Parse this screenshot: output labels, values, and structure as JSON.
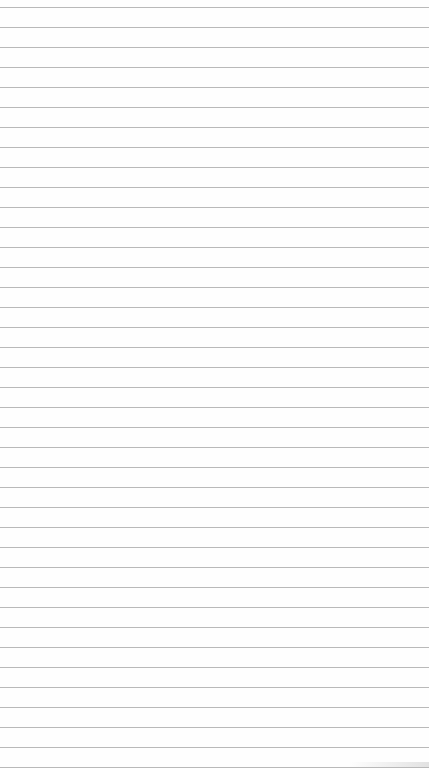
{
  "paper": {
    "type": "lined-paper",
    "background_color": "#fefefe",
    "line_color": "#b9b9b9",
    "first_line_y": 7,
    "line_spacing": 20,
    "line_count": 39
  }
}
